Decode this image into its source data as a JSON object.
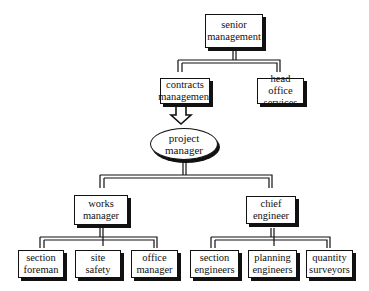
{
  "diagram": {
    "title": "",
    "nodes": {
      "senior_management": {
        "line1": "senior",
        "line2": "management"
      },
      "contracts_management": {
        "line1": "contracts",
        "line2": "management"
      },
      "head_office_services": {
        "line1": "head office",
        "line2": "services"
      },
      "project_manager": {
        "line1": "project",
        "line2": "manager"
      },
      "works_manager": {
        "line1": "works",
        "line2": "manager"
      },
      "chief_engineer": {
        "line1": "chief",
        "line2": "engineer"
      },
      "section_foreman": {
        "line1": "section",
        "line2": "foreman"
      },
      "site_safety": {
        "line1": "site",
        "line2": "safety"
      },
      "office_manager": {
        "line1": "office",
        "line2": "manager"
      },
      "section_engineers": {
        "line1": "section",
        "line2": "engineers"
      },
      "planning_engineers": {
        "line1": "planning",
        "line2": "engineers"
      },
      "quantity_surveyors": {
        "line1": "quantity",
        "line2": "surveyors"
      }
    },
    "edges": [
      [
        "senior_management",
        "contracts_management"
      ],
      [
        "senior_management",
        "head_office_services"
      ],
      [
        "contracts_management",
        "project_manager"
      ],
      [
        "project_manager",
        "works_manager"
      ],
      [
        "project_manager",
        "chief_engineer"
      ],
      [
        "works_manager",
        "section_foreman"
      ],
      [
        "works_manager",
        "site_safety"
      ],
      [
        "works_manager",
        "office_manager"
      ],
      [
        "chief_engineer",
        "section_engineers"
      ],
      [
        "chief_engineer",
        "planning_engineers"
      ],
      [
        "chief_engineer",
        "quantity_surveyors"
      ]
    ]
  }
}
